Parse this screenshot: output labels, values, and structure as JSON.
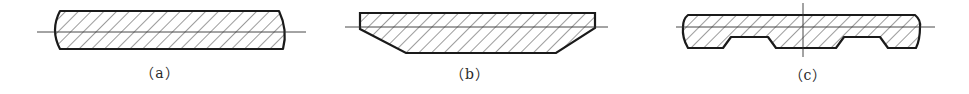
{
  "diagram": {
    "colors": {
      "outline": "#1a1a1a",
      "hatch": "#3a3a3a",
      "centerline": "#333333",
      "background": "#ffffff"
    },
    "figures": [
      {
        "id": "a",
        "label": "（a）",
        "shape": "rectangle with convex rounded ends",
        "label_x": 160,
        "label_y": 62
      },
      {
        "id": "b",
        "label": "（b）",
        "shape": "trapezoid with chamfered lower corners",
        "label_x": 470,
        "label_y": 63
      },
      {
        "id": "c",
        "label": "（c）",
        "shape": "strip with two bottom grooves and rounded ends",
        "label_x": 808,
        "label_y": 64
      }
    ]
  }
}
